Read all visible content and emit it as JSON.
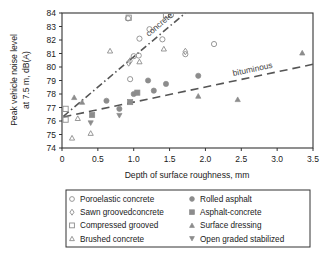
{
  "chart_data": {
    "type": "scatter",
    "title": "",
    "xlabel": "Depth of surface roughness, mm",
    "ylabel_line1": "Peak vehicle noise level",
    "ylabel_line2": "at 7.5 m, dB(A)",
    "xlim": [
      0,
      3.5
    ],
    "ylim": [
      74,
      84
    ],
    "xticks": [
      "0",
      "0.5",
      "1.0",
      "1.5",
      "2.0",
      "2.5",
      "3.0",
      "3.5"
    ],
    "xtick_values": [
      0,
      0.5,
      1.0,
      1.5,
      2.0,
      2.5,
      3.0,
      3.5
    ],
    "yticks": [
      "74",
      "75",
      "76",
      "77",
      "78",
      "79",
      "80",
      "81",
      "82",
      "83",
      "84"
    ],
    "ytick_values": [
      74,
      75,
      76,
      77,
      78,
      79,
      80,
      81,
      82,
      83,
      84
    ],
    "grid": false,
    "legend_position": "below-plot",
    "marker_color": "#8c8c8c",
    "line_color": "#555555",
    "frame_color": "#333333",
    "series": [
      {
        "name": "Poroelastic concrete",
        "marker": "open-circle",
        "points": [
          [
            0.92,
            83.6
          ],
          [
            1.08,
            82.1
          ],
          [
            1.22,
            82.8
          ],
          [
            1.0,
            80.8
          ],
          [
            1.07,
            80.85
          ],
          [
            1.4,
            82.05
          ],
          [
            0.95,
            79.1
          ],
          [
            1.72,
            80.95
          ],
          [
            2.12,
            81.7
          ],
          [
            1.52,
            83.85
          ]
        ]
      },
      {
        "name": "Sawn groovedconcrete",
        "marker": "open-diamond",
        "points": [
          [
            0.93,
            80.3
          ],
          [
            0.95,
            80.45
          ],
          [
            1.72,
            81.15
          ]
        ]
      },
      {
        "name": "Compressed grooved",
        "marker": "open-square",
        "points": [
          [
            0.93,
            83.65
          ],
          [
            1.45,
            83.85
          ],
          [
            0.05,
            76.9
          ],
          [
            0.05,
            76.1
          ]
        ]
      },
      {
        "name": "Brushed concrete",
        "marker": "open-triangle-up",
        "points": [
          [
            0.67,
            81.2
          ],
          [
            1.42,
            81.35
          ],
          [
            0.22,
            76.2
          ],
          [
            0.4,
            75.1
          ],
          [
            0.14,
            74.75
          ],
          [
            1.08,
            80.4
          ]
        ]
      },
      {
        "name": "Rolled asphalt",
        "marker": "filled-circle",
        "points": [
          [
            1.2,
            79.0
          ],
          [
            1.28,
            78.25
          ],
          [
            1.45,
            78.75
          ],
          [
            1.9,
            79.35
          ],
          [
            0.8,
            76.9
          ],
          [
            1.0,
            78.0
          ],
          [
            0.62,
            77.5
          ]
        ]
      },
      {
        "name": "Asphalt-concrete",
        "marker": "filled-square",
        "points": [
          [
            0.95,
            77.4
          ],
          [
            0.42,
            76.45
          ],
          [
            1.05,
            78.1
          ]
        ]
      },
      {
        "name": "Surface dressing",
        "marker": "filled-triangle-up",
        "points": [
          [
            0.17,
            77.75
          ],
          [
            0.28,
            77.4
          ],
          [
            3.35,
            81.05
          ],
          [
            2.45,
            77.6
          ],
          [
            1.9,
            77.85
          ]
        ]
      },
      {
        "name": "Open graded stabilized",
        "marker": "filled-triangle-down",
        "points": [
          [
            0.4,
            75.85
          ],
          [
            0.8,
            76.4
          ]
        ]
      }
    ],
    "trendlines": [
      {
        "name": "concrete",
        "label": "concrete",
        "style": "dash-dot",
        "from": [
          0.02,
          76.35
        ],
        "to": [
          1.72,
          84.0
        ]
      },
      {
        "name": "bituminous",
        "label": "bituminous",
        "style": "dashed",
        "from": [
          0.02,
          76.3
        ],
        "to": [
          3.5,
          80.2
        ]
      }
    ]
  },
  "legend": {
    "items": [
      {
        "label": "Poroelastic concrete",
        "marker": "open-circle"
      },
      {
        "label": "Rolled asphalt",
        "marker": "filled-circle"
      },
      {
        "label": "Sawn groovedconcrete",
        "marker": "open-diamond"
      },
      {
        "label": "Asphalt-concrete",
        "marker": "filled-square"
      },
      {
        "label": "Compressed grooved",
        "marker": "open-square"
      },
      {
        "label": "Surface dressing",
        "marker": "filled-triangle-up"
      },
      {
        "label": "Brushed concrete",
        "marker": "open-triangle-up"
      },
      {
        "label": "Open graded stabilized",
        "marker": "filled-triangle-down"
      }
    ]
  }
}
